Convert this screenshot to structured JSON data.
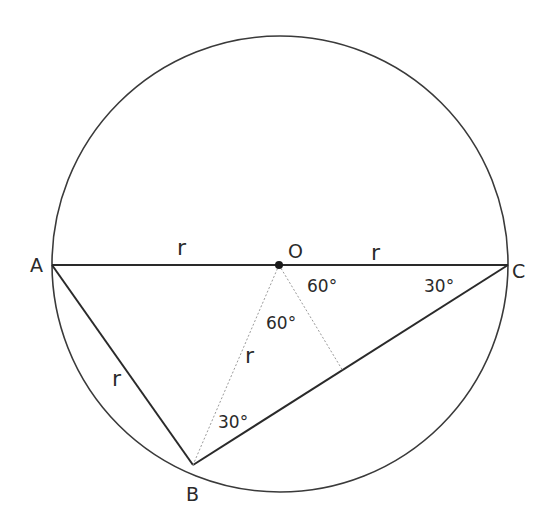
{
  "diagram": {
    "colors": {
      "stroke": "#3a3a3a",
      "dotted": "#9a9a9a",
      "text": "#2a2a2a",
      "background": "#ffffff"
    },
    "circle": {
      "cx": 280,
      "cy": 263,
      "r": 228
    },
    "points": {
      "A": {
        "label": "A",
        "x": 52,
        "y": 265
      },
      "O": {
        "label": "O",
        "x": 279,
        "y": 265
      },
      "C": {
        "label": "C",
        "x": 508,
        "y": 265
      },
      "B": {
        "label": "B",
        "x": 193,
        "y": 465
      },
      "D": {
        "x": 343,
        "y": 371
      }
    },
    "segments": [
      {
        "from": "A",
        "to": "C",
        "style": "solid",
        "label": "diameter"
      },
      {
        "from": "A",
        "to": "B",
        "style": "solid",
        "label": "r"
      },
      {
        "from": "B",
        "to": "C",
        "style": "solid"
      },
      {
        "from": "O",
        "to": "B",
        "style": "dotted",
        "label": "r"
      },
      {
        "from": "O",
        "to": "D",
        "style": "dotted"
      }
    ],
    "labels": {
      "r_AO": "r",
      "r_OC": "r",
      "r_AB": "r",
      "r_OB": "r",
      "angle_COD": "60°",
      "angle_DOB": "60°",
      "angle_OCB": "30°",
      "angle_OBC": "30°"
    }
  }
}
